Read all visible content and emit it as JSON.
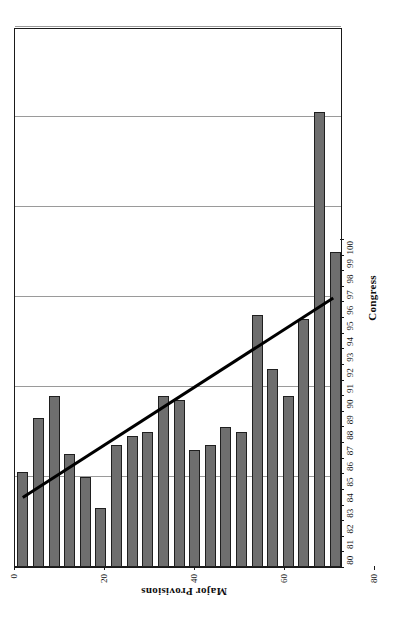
{
  "chart_data": {
    "type": "bar",
    "orientation": "horizontal",
    "title": "",
    "xlabel": "Congress",
    "ylabel": "Major Provisions",
    "categories": [
      "80",
      "81",
      "82",
      "83",
      "84",
      "85",
      "86",
      "87",
      "88",
      "89",
      "90",
      "91",
      "92",
      "93",
      "94",
      "95",
      "96",
      "97",
      "98",
      "99",
      "100"
    ],
    "values": [
      21,
      33,
      38,
      25,
      20,
      13,
      27,
      29,
      30,
      38,
      37,
      26,
      27,
      31,
      30,
      56,
      44,
      38,
      55,
      101,
      70
    ],
    "series": [
      {
        "name": "Major Provisions",
        "values": [
          21,
          33,
          38,
          25,
          20,
          13,
          27,
          29,
          30,
          38,
          37,
          26,
          27,
          31,
          30,
          56,
          44,
          38,
          55,
          101,
          70
        ]
      }
    ],
    "ylim": [
      0,
      120
    ],
    "value_ticks": [
      0,
      20,
      40,
      60,
      80,
      100,
      120
    ],
    "grid": true,
    "legend": "none",
    "annotations": [
      {
        "type": "trendline",
        "name": "linear-trend",
        "start": {
          "category": "80",
          "value": 15.5
        },
        "end": {
          "category": "100",
          "value": 60.0
        },
        "color": "#000000"
      }
    ],
    "colors": {
      "bar_fill": "#6e6e6e",
      "bar_stroke": "#1f1f1f",
      "gridline": "#9a9a9a",
      "axis": "#1a1a1a",
      "trendline": "#000000",
      "background": "#ffffff"
    }
  },
  "axes": {
    "category_axis_title": "Congress",
    "value_axis_title": "Major Provisions"
  }
}
